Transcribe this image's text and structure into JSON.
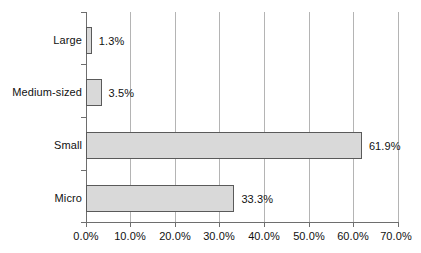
{
  "chart_data": {
    "type": "bar",
    "orientation": "horizontal",
    "title": "",
    "xlabel": "",
    "ylabel": "",
    "categories": [
      "Large",
      "Medium-sized",
      "Small",
      "Micro"
    ],
    "values": [
      1.3,
      3.5,
      61.9,
      33.3
    ],
    "data_labels": [
      "1.3%",
      "3.5%",
      "61.9%",
      "33.3%"
    ],
    "xlim": [
      0,
      70
    ],
    "xticks": [
      0,
      10,
      20,
      30,
      40,
      50,
      60,
      70
    ],
    "xtick_labels": [
      "0.0%",
      "10.0%",
      "20.0%",
      "30.0%",
      "40.0%",
      "50.0%",
      "60.0%",
      "70.0%"
    ],
    "grid": "vertical",
    "legend": null,
    "series": [
      {
        "name": "",
        "values": [
          1.3,
          3.5,
          61.9,
          33.3
        ]
      }
    ],
    "colors": {
      "bar_fill": "#d9d9d9",
      "bar_border": "#5a5a5a",
      "gridline": "#b4b4b4",
      "axis": "#6e6e6e",
      "text": "#111111",
      "background": "#ffffff"
    }
  }
}
